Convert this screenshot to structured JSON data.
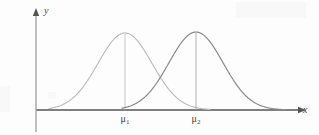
{
  "figure": {
    "background_color": "#fdfdfd",
    "axis_color": "#555555",
    "axes": {
      "x_label": "x",
      "y_label": "y",
      "x_origin_px": 36,
      "y_baseline_px": 110,
      "x_end_px": 300,
      "y_top_px": 10
    },
    "tick_labels": [
      {
        "name": "mu1",
        "base": "μ",
        "subscript": "1",
        "x_px": 125
      },
      {
        "name": "mu2",
        "base": "μ",
        "subscript": "2",
        "x_px": 196
      }
    ]
  },
  "chart_data": {
    "type": "line",
    "title": "",
    "xlabel": "x",
    "ylabel": "y",
    "grid": false,
    "legend": "none",
    "xlim": [
      0,
      319
    ],
    "ylim": [
      0,
      135
    ],
    "annotations": [
      "μ₁",
      "μ₂"
    ],
    "series": [
      {
        "name": "curve-1",
        "distribution": "normal",
        "mean_px": 125,
        "sigma_px": 27,
        "peak_y_px": 33,
        "baseline_y_px": 110,
        "left_tail_px": 49,
        "right_tail_px": 210,
        "color": "#b9b9b9",
        "stroke_width": 1.1,
        "has_peak_line": true
      },
      {
        "name": "curve-2",
        "distribution": "normal",
        "mean_px": 196,
        "sigma_px": 27,
        "peak_y_px": 32,
        "baseline_y_px": 110,
        "left_tail_px": 122,
        "right_tail_px": 286,
        "color": "#8a8a8a",
        "stroke_width": 1.2,
        "has_peak_line": true
      }
    ],
    "intersection_px": {
      "x": 161,
      "y": 72
    }
  }
}
